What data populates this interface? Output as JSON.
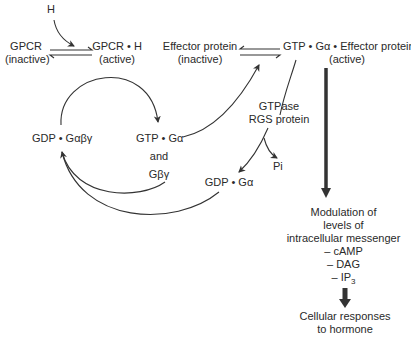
{
  "diagram": {
    "nodes": {
      "hormone": "H",
      "gpcr_inactive": {
        "line1": "GPCR",
        "line2": "(inactive)"
      },
      "gpcr_active": {
        "line1": "GPCR • H",
        "line2": "(active)"
      },
      "effector_inactive": {
        "line1": "Effector protein",
        "line2": "(inactive)"
      },
      "effector_active": {
        "line1": "GTP • Gα • Effector protein",
        "line2": "(active)"
      },
      "gdp_gabg": "GDP • Gαβγ",
      "gtp_ga": "GTP • Gα",
      "and": "and",
      "gbg": "Gβγ",
      "gtpase": {
        "line1": "GTPase",
        "line2": "RGS protein"
      },
      "pi": "Pi",
      "gdp_ga": "GDP • Gα",
      "modulation": {
        "line1": "Modulation of",
        "line2": "levels of",
        "line3": "intracellular messenger",
        "items": [
          "– cAMP",
          "– DAG",
          "– IP"
        ],
        "ip_subscript": "3"
      },
      "response": {
        "line1": "Cellular responses",
        "line2": "to hormone"
      }
    },
    "colors": {
      "line": "#333333",
      "text": "#2a2a2a",
      "background": "#ffffff"
    }
  }
}
